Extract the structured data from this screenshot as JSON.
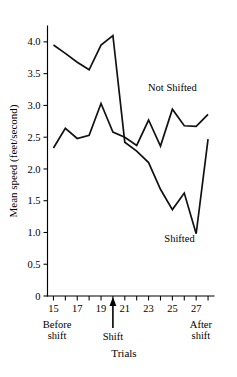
{
  "chart_data": {
    "type": "line",
    "title": "",
    "xlabel": "Trials",
    "ylabel": "Mean speed (feet/second)",
    "x": [
      15,
      16,
      17,
      18,
      19,
      20,
      21,
      22,
      23,
      24,
      25,
      26,
      27,
      28
    ],
    "xlim": [
      14.5,
      28.5
    ],
    "ylim": [
      0,
      4.25
    ],
    "grid": false,
    "legend_position": "inline-labels",
    "x_ticks": [
      15,
      16,
      17,
      18,
      19,
      20,
      21,
      22,
      23,
      24,
      25,
      26,
      27,
      28
    ],
    "x_tick_labels": [
      "15",
      "",
      "17",
      "",
      "19",
      "",
      "21",
      "",
      "23",
      "",
      "25",
      "",
      "27",
      ""
    ],
    "y_ticks": [
      0,
      0.5,
      1.0,
      1.5,
      2.0,
      2.5,
      3.0,
      3.5,
      4.0
    ],
    "y_tick_labels": [
      "0",
      "0.5",
      "1.0",
      "1.5",
      "2.0",
      "2.5",
      "3.0",
      "3.5",
      "4.0"
    ],
    "series": [
      {
        "name": "Shifted",
        "label": "Shifted",
        "values": [
          3.95,
          3.82,
          3.68,
          3.56,
          3.95,
          4.1,
          2.42,
          2.28,
          2.1,
          1.68,
          1.36,
          1.62,
          0.98,
          2.47
        ]
      },
      {
        "name": "Not Shifted",
        "label": "Not Shifted",
        "values": [
          2.33,
          2.64,
          2.48,
          2.53,
          3.03,
          2.58,
          2.5,
          2.37,
          2.77,
          2.36,
          2.94,
          2.68,
          2.67,
          2.86
        ]
      }
    ],
    "annotations": [
      {
        "name": "before-shift",
        "text_line1": "Before",
        "text_line2": "shift",
        "at_x": 15.3
      },
      {
        "name": "shift-marker",
        "text": "Shift",
        "at_x": 20,
        "arrow": true
      },
      {
        "name": "after-shift",
        "text_line1": "After",
        "text_line2": "shift",
        "at_x": 27.4
      }
    ],
    "series_label_positions": [
      {
        "name": "Not Shifted",
        "at_x": 25.0,
        "at_y": 3.22
      },
      {
        "name": "Shifted",
        "at_x": 25.6,
        "at_y": 0.85
      }
    ],
    "colors": {
      "line": "#111111",
      "axis": "#000000",
      "background": "#ffffff"
    }
  }
}
